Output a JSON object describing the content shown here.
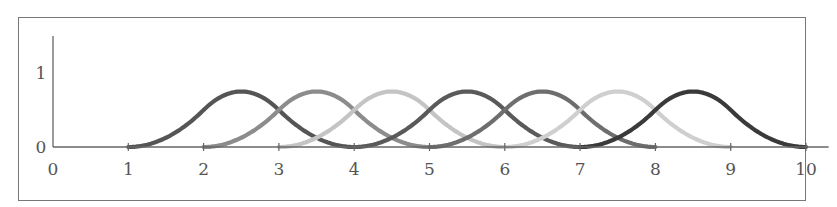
{
  "chart_data": {
    "type": "line",
    "title": "",
    "xlabel": "",
    "ylabel": "",
    "xlim": [
      0,
      10.3
    ],
    "ylim": [
      0,
      1.4
    ],
    "x_ticks": [
      "0",
      "1",
      "2",
      "3",
      "4",
      "5",
      "6",
      "7",
      "8",
      "9",
      "10"
    ],
    "y_ticks": [
      "0",
      "1"
    ],
    "grid": false,
    "legend": null,
    "series": [
      {
        "name": "N1",
        "support": [
          1,
          4
        ],
        "peak_x": 2.5,
        "peak_y": 0.75,
        "color": "#555555"
      },
      {
        "name": "N2",
        "support": [
          2,
          5
        ],
        "peak_x": 3.5,
        "peak_y": 0.75,
        "color": "#8c8c8c"
      },
      {
        "name": "N3",
        "support": [
          3,
          6
        ],
        "peak_x": 4.5,
        "peak_y": 0.75,
        "color": "#c4c4c4"
      },
      {
        "name": "N4",
        "support": [
          4,
          7
        ],
        "peak_x": 5.5,
        "peak_y": 0.75,
        "color": "#5a5a5a"
      },
      {
        "name": "N5",
        "support": [
          5,
          8
        ],
        "peak_x": 6.5,
        "peak_y": 0.75,
        "color": "#6e6e6e"
      },
      {
        "name": "N6",
        "support": [
          6,
          9
        ],
        "peak_x": 7.5,
        "peak_y": 0.75,
        "color": "#cfcfcf"
      },
      {
        "name": "N7",
        "support": [
          7,
          10
        ],
        "peak_x": 8.5,
        "peak_y": 0.75,
        "color": "#3a3a3a"
      }
    ]
  },
  "axis": {
    "color": "#666666",
    "x_origin_px": 53,
    "x_unit_px": 75.3,
    "y_origin_px": 147,
    "y_unit_px": 74
  }
}
